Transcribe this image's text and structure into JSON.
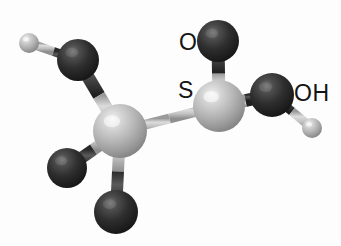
{
  "figure": {
    "molecule_name": "2-hydroxyethanesulfinyl / thio-substituted ethanol fragment",
    "width": 341,
    "height": 246,
    "background_color": "#fdfdfd",
    "rendering_style": "grayscale ball-and-stick 3D render"
  },
  "palette": {
    "dark_atom_base": "#2b2b2b",
    "dark_atom_highlight": "#6e6e6e",
    "dark_atom_shadow": "#141414",
    "light_atom_base": "#b9b9b9",
    "light_atom_highlight": "#efefef",
    "light_atom_shadow": "#7d7d7d",
    "small_atom_base": "#b0b0b0",
    "small_atom_highlight": "#e8e8e8",
    "bond_light": "#c9c9c9",
    "bond_dark": "#3a3a3a",
    "label_color": "#141414"
  },
  "labels": [
    {
      "id": "label-o-top",
      "text": "O",
      "x": 179,
      "y": 31,
      "font_size": 23
    },
    {
      "id": "label-s",
      "text": "S",
      "x": 178,
      "y": 79,
      "font_size": 23
    },
    {
      "id": "label-oh",
      "text": "OH",
      "x": 294,
      "y": 82,
      "font_size": 23
    }
  ],
  "atoms": [
    {
      "id": "h-methyl",
      "element": "H",
      "shade": "light",
      "cx": 29,
      "cy": 43,
      "r": 10
    },
    {
      "id": "c-methyl",
      "element": "C",
      "shade": "dark",
      "cx": 78,
      "cy": 60,
      "r": 21
    },
    {
      "id": "c-central",
      "element": "C",
      "shade": "light",
      "cx": 120,
      "cy": 131,
      "r": 27
    },
    {
      "id": "c-left-lower",
      "element": "C",
      "shade": "dark",
      "cx": 67,
      "cy": 168,
      "r": 20
    },
    {
      "id": "c-bottom",
      "element": "C",
      "shade": "dark",
      "cx": 116,
      "cy": 212,
      "r": 22
    },
    {
      "id": "s-center",
      "element": "S",
      "shade": "light",
      "cx": 219,
      "cy": 106,
      "r": 26
    },
    {
      "id": "o-top",
      "element": "O",
      "shade": "dark",
      "cx": 218,
      "cy": 41,
      "r": 21
    },
    {
      "id": "o-hydroxyl",
      "element": "O",
      "shade": "dark",
      "cx": 272,
      "cy": 95,
      "r": 22
    },
    {
      "id": "h-hydroxyl",
      "element": "H",
      "shade": "light",
      "cx": 312,
      "cy": 128,
      "r": 10
    }
  ],
  "bonds": [
    {
      "id": "bond-h-methyl-c-methyl",
      "from": "h-methyl",
      "to": "c-methyl",
      "thickness": 9,
      "shade": "mixed"
    },
    {
      "id": "bond-c-methyl-c-central",
      "from": "c-methyl",
      "to": "c-central",
      "thickness": 13,
      "shade": "mixed"
    },
    {
      "id": "bond-c-central-c-left-lower",
      "from": "c-central",
      "to": "c-left-lower",
      "thickness": 12,
      "shade": "mixed"
    },
    {
      "id": "bond-c-central-c-bottom",
      "from": "c-central",
      "to": "c-bottom",
      "thickness": 12,
      "shade": "mixed"
    },
    {
      "id": "bond-c-central-s-center",
      "from": "c-central",
      "to": "s-center",
      "thickness": 10,
      "shade": "light"
    },
    {
      "id": "bond-s-center-o-top",
      "from": "s-center",
      "to": "o-top",
      "thickness": 13,
      "shade": "mixed"
    },
    {
      "id": "bond-s-center-o-hydroxyl",
      "from": "s-center",
      "to": "o-hydroxyl",
      "thickness": 13,
      "shade": "mixed"
    },
    {
      "id": "bond-o-hydroxyl-h-hydroxyl",
      "from": "o-hydroxyl",
      "to": "h-hydroxyl",
      "thickness": 9,
      "shade": "mixed"
    }
  ]
}
